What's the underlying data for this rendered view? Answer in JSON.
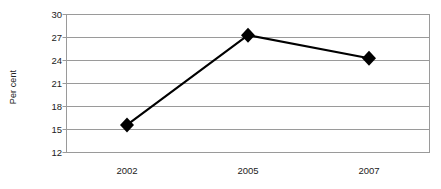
{
  "chart_data": {
    "type": "line",
    "title": "",
    "subtitle": "",
    "xlabel": "",
    "ylabel": "Per cent",
    "categories": [
      "2002",
      "2005",
      "2007"
    ],
    "values": [
      15.6,
      27.3,
      24.3
    ],
    "series": [
      {
        "name": "Per cent",
        "values": [
          15.6,
          27.3,
          24.3
        ],
        "marker": "diamond",
        "marker_color": "#000000",
        "line_color": "#000000"
      }
    ],
    "ylim": [
      12,
      30
    ],
    "yticks": [
      12,
      15,
      18,
      21,
      24,
      27,
      30
    ],
    "ytick_labels": [
      "12",
      "15",
      "18",
      "21",
      "24",
      "27",
      "30"
    ],
    "xtick_labels": [
      "2002",
      "2005",
      "2007"
    ],
    "grid": true,
    "grid_axis": "y",
    "grid_color": "#9a9a9a",
    "frame_color": "#9a9a9a",
    "legend": false,
    "legend_position": "none",
    "background": "#ffffff",
    "annotations": []
  },
  "axis": {
    "y_title": "Per cent"
  }
}
